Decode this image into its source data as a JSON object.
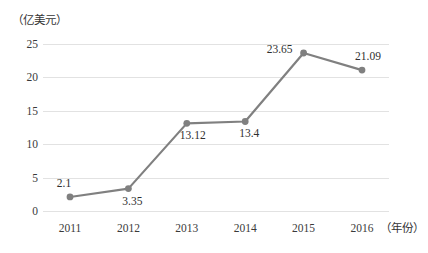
{
  "chart_data": {
    "type": "line",
    "title": "",
    "subtitle": "",
    "xlabel": "（年份）",
    "ylabel": "（亿美元）",
    "categories": [
      "2011",
      "2012",
      "2013",
      "2014",
      "2015",
      "2016"
    ],
    "values": [
      2.1,
      3.35,
      13.12,
      13.4,
      23.65,
      21.09
    ],
    "data_labels": [
      "2.1",
      "3.35",
      "13.12",
      "13.4",
      "23.65",
      "21.09"
    ],
    "series": [
      {
        "name": "",
        "values": [
          2.1,
          3.35,
          13.12,
          13.4,
          23.65,
          21.09
        ]
      }
    ],
    "ylim": [
      0,
      25
    ],
    "yticks": [
      0,
      5,
      10,
      15,
      20,
      25
    ],
    "ytick_labels": [
      "0",
      "5",
      "10",
      "15",
      "20",
      "25"
    ],
    "grid": "horizontal",
    "legend": "none",
    "marker": "circle",
    "colors": {
      "line": "#808080",
      "marker": "#808080",
      "gridline": "#e2e2e2",
      "text": "#3a3a3a",
      "background": "#ffffff"
    },
    "label_offsets": [
      {
        "dx": -6,
        "dy": -14
      },
      {
        "dx": 4,
        "dy": 12
      },
      {
        "dx": 6,
        "dy": 12
      },
      {
        "dx": 4,
        "dy": 12
      },
      {
        "dx": -24,
        "dy": -4
      },
      {
        "dx": 6,
        "dy": -14
      }
    ]
  }
}
